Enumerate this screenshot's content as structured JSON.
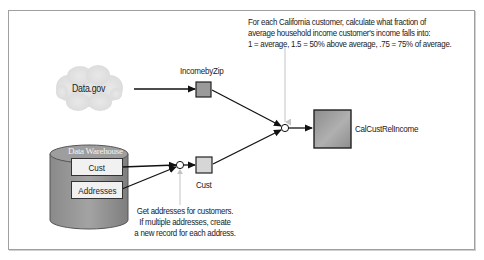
{
  "diagram": {
    "type": "data-flow",
    "top_note": {
      "lines": [
        "For each California customer, calculate what fraction of",
        "average household income customer's income falls into:",
        "1 = average, 1.5 = 50% above average, .75 = 75% of average."
      ]
    },
    "bottom_note": {
      "lines": [
        "Get addresses for customers.",
        "If multiple addresses, create",
        "a new record for each address."
      ]
    },
    "sources": {
      "cloud": {
        "label": "Data.gov"
      },
      "warehouse": {
        "title": "Data Warehouse",
        "tables": [
          "Cust",
          "Addresses"
        ]
      }
    },
    "nodes": {
      "income_by_zip": {
        "label": "IncomebyZip"
      },
      "cust": {
        "label": "Cust"
      },
      "result": {
        "label": "CalCustRelIncome"
      }
    },
    "edges": [
      {
        "from": "Data.gov",
        "to": "IncomebyZip"
      },
      {
        "from": "Data Warehouse.Cust",
        "to": "join-1"
      },
      {
        "from": "Data Warehouse.Addresses",
        "to": "join-1"
      },
      {
        "from": "join-1",
        "to": "Cust"
      },
      {
        "from": "IncomebyZip",
        "to": "join-2"
      },
      {
        "from": "Cust",
        "to": "join-2"
      },
      {
        "from": "join-2",
        "to": "CalCustRelIncome"
      }
    ],
    "colors": {
      "frame": "#a0a0a0",
      "arrow": "#111111",
      "note_pointer": "#b8b8b8",
      "cloud": "#e2e2e2",
      "cylinder": "#8a8a8a",
      "node_fill": "#9a9a9a",
      "cust_fill": "#d6d6d6",
      "table_fill": "#f1f1f1"
    }
  }
}
